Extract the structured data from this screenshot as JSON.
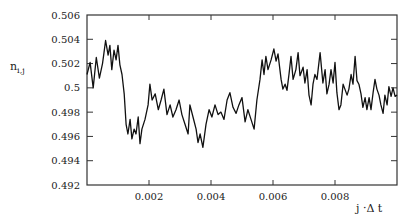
{
  "chart_data": {
    "type": "line",
    "title": "",
    "xlabel": "j ·Δ t",
    "ylabel": "n_{i,j}",
    "xlim": [
      0,
      0.01
    ],
    "ylim": [
      0.492,
      0.506
    ],
    "grid": false,
    "legend": null,
    "x_ticks": [
      0.002,
      0.004,
      0.006,
      0.008
    ],
    "x_tick_labels": [
      "0.002",
      "0.004",
      "0.006",
      "0.008"
    ],
    "y_ticks": [
      0.492,
      0.494,
      0.496,
      0.498,
      0.5,
      0.502,
      0.504,
      0.506
    ],
    "y_tick_labels": [
      "0.492",
      "0.494",
      "0.496",
      "0.498",
      "0.5",
      "0.502",
      "0.504",
      "0.506"
    ],
    "series": [
      {
        "name": "n_{i,j}",
        "color": "#111111",
        "x": [
          0.0,
          0.0001,
          0.0002,
          0.0003,
          0.0004,
          0.0005,
          0.00055,
          0.0006,
          0.00068,
          0.00074,
          0.0008,
          0.00087,
          0.00094,
          0.001,
          0.00106,
          0.00113,
          0.0012,
          0.00126,
          0.00132,
          0.00139,
          0.00145,
          0.00152,
          0.00158,
          0.00165,
          0.00171,
          0.00177,
          0.00187,
          0.00197,
          0.00203,
          0.0021,
          0.0022,
          0.0023,
          0.00239,
          0.00248,
          0.00258,
          0.00268,
          0.00277,
          0.00287,
          0.00297,
          0.00306,
          0.00316,
          0.00326,
          0.00332,
          0.00342,
          0.00352,
          0.00358,
          0.00365,
          0.00374,
          0.00384,
          0.00394,
          0.00403,
          0.00413,
          0.00423,
          0.00432,
          0.00442,
          0.00452,
          0.00461,
          0.00471,
          0.00481,
          0.0049,
          0.005,
          0.0051,
          0.00519,
          0.00529,
          0.00539,
          0.00548,
          0.00558,
          0.00565,
          0.00571,
          0.00577,
          0.00584,
          0.00594,
          0.00603,
          0.0061,
          0.00616,
          0.00626,
          0.00632,
          0.00639,
          0.00645,
          0.00652,
          0.00658,
          0.00665,
          0.00674,
          0.00681,
          0.00687,
          0.00697,
          0.00703,
          0.0071,
          0.00716,
          0.00723,
          0.00729,
          0.00735,
          0.00742,
          0.00752,
          0.00761,
          0.00768,
          0.00774,
          0.00781,
          0.00787,
          0.00794,
          0.008,
          0.00806,
          0.00813,
          0.00819,
          0.00826,
          0.00832,
          0.00839,
          0.00845,
          0.00852,
          0.00858,
          0.00865,
          0.00871,
          0.00877,
          0.00884,
          0.0089,
          0.00897,
          0.00903,
          0.0091,
          0.00916,
          0.00923,
          0.00929,
          0.00935,
          0.00942,
          0.00948,
          0.00955,
          0.00961,
          0.00968,
          0.00974,
          0.00981,
          0.00987,
          0.00994,
          0.01
        ],
        "y": [
          0.5011,
          0.5021,
          0.5,
          0.5025,
          0.5008,
          0.502,
          0.5029,
          0.5039,
          0.5027,
          0.5035,
          0.5015,
          0.5031,
          0.5023,
          0.5035,
          0.5019,
          0.5011,
          0.4995,
          0.497,
          0.4962,
          0.4974,
          0.4958,
          0.4966,
          0.4962,
          0.4976,
          0.4954,
          0.4966,
          0.4974,
          0.4986,
          0.5003,
          0.499,
          0.4995,
          0.4982,
          0.499,
          0.4999,
          0.4978,
          0.4986,
          0.4976,
          0.4982,
          0.499,
          0.4978,
          0.497,
          0.4962,
          0.4986,
          0.4976,
          0.4966,
          0.4955,
          0.4962,
          0.4951,
          0.497,
          0.4982,
          0.4976,
          0.4986,
          0.4978,
          0.498,
          0.4974,
          0.499,
          0.4996,
          0.4984,
          0.4979,
          0.4986,
          0.4992,
          0.4972,
          0.4982,
          0.4974,
          0.4966,
          0.499,
          0.5007,
          0.5023,
          0.5011,
          0.5026,
          0.5015,
          0.5023,
          0.5032,
          0.5022,
          0.5028,
          0.5007,
          0.4999,
          0.5003,
          0.4998,
          0.5012,
          0.5026,
          0.5007,
          0.5015,
          0.5029,
          0.501,
          0.5017,
          0.5004,
          0.5015,
          0.4994,
          0.4986,
          0.5003,
          0.5011,
          0.5007,
          0.5029,
          0.5004,
          0.5015,
          0.4995,
          0.5003,
          0.5015,
          0.5004,
          0.5021,
          0.4996,
          0.4982,
          0.4986,
          0.5003,
          0.4999,
          0.4994,
          0.4999,
          0.5011,
          0.5003,
          0.5026,
          0.5006,
          0.5003,
          0.4995,
          0.4984,
          0.4992,
          0.4982,
          0.4992,
          0.4982,
          0.4996,
          0.5007,
          0.4999,
          0.4994,
          0.4986,
          0.4979,
          0.4994,
          0.4986,
          0.5001,
          0.4993,
          0.5,
          0.4993,
          0.4994
        ]
      }
    ]
  },
  "labels": {
    "ylabel_main": "n",
    "ylabel_sub": "i,j",
    "xlabel": "j ·Δ t"
  }
}
